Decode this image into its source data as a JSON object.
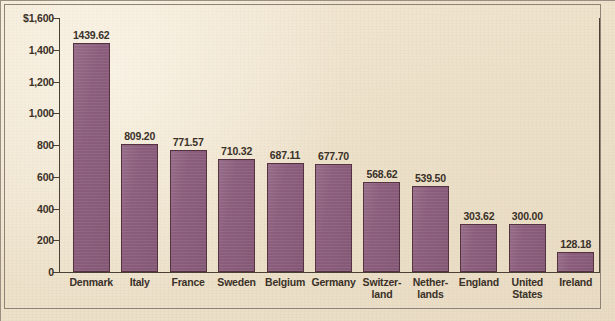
{
  "chart_data": {
    "type": "bar",
    "title": "",
    "subtitle": "",
    "xlabel": "",
    "ylabel": "",
    "ylim": [
      0,
      1600
    ],
    "ytick_values": [
      0,
      200,
      400,
      600,
      800,
      1000,
      1200,
      1400,
      1600
    ],
    "ytick_labels": [
      "0",
      "200",
      "400",
      "600",
      "800",
      "1,000",
      "1,200",
      "1,400",
      "$1,600"
    ],
    "grid": false,
    "legend": false,
    "currency_symbol": "$",
    "categories": [
      "Denmark",
      "Italy",
      "France",
      "Sweden",
      "Belgium",
      "Germany",
      "Switzerland",
      "Netherlands",
      "England",
      "United States",
      "Ireland"
    ],
    "category_label_lines": [
      [
        "Denmark"
      ],
      [
        "Italy"
      ],
      [
        "France"
      ],
      [
        "Sweden"
      ],
      [
        "Belgium"
      ],
      [
        "Germany"
      ],
      [
        "Switzer-",
        "land"
      ],
      [
        "Nether-",
        "lands"
      ],
      [
        "England"
      ],
      [
        "United",
        "States"
      ],
      [
        "Ireland"
      ]
    ],
    "values": [
      1439.62,
      809.2,
      771.57,
      710.32,
      687.11,
      677.7,
      568.62,
      539.5,
      303.62,
      300.0,
      128.18
    ],
    "value_labels": [
      "1439.62",
      "809.20",
      "771.57",
      "710.32",
      "687.11",
      "677.70",
      "568.62",
      "539.50",
      "303.62",
      "300.00",
      "128.18"
    ]
  },
  "style": {
    "bar_fill": "#8d5f7e",
    "bar_stroke": "#55323f",
    "background": "#efe3cd",
    "axis_color": "#4b4036",
    "text_color": "#3a3128",
    "frame_color": "#8e8374"
  }
}
